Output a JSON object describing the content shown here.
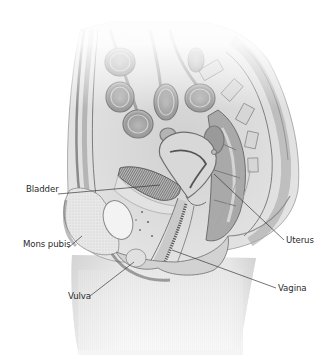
{
  "figure": {
    "colors": {
      "background": "#ffffff",
      "tissue_light": "#e4e4e4",
      "tissue_mid": "#c4c4c4",
      "tissue_dark": "#8e8e8e",
      "outline": "#6e6e6e",
      "leader_line": "#3a3a3a",
      "label_text": "#2a2a2a"
    },
    "labels": [
      {
        "id": "bladder",
        "text": "Bladder",
        "x": 26,
        "y": 189,
        "anchor": "left"
      },
      {
        "id": "mons-pubis",
        "text": "Mons pubis",
        "x": 23,
        "y": 244,
        "anchor": "left"
      },
      {
        "id": "vulva",
        "text": "Vulva",
        "x": 68,
        "y": 292,
        "anchor": "left"
      },
      {
        "id": "uterus",
        "text": "Uterus",
        "x": 286,
        "y": 237,
        "anchor": "left"
      },
      {
        "id": "vagina",
        "text": "Vagina",
        "x": 278,
        "y": 284,
        "anchor": "left"
      }
    ]
  }
}
